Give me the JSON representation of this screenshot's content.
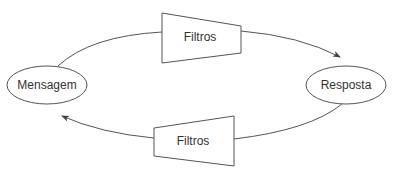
{
  "diagram": {
    "nodes": {
      "message": {
        "label": "Mensagem",
        "shape": "ellipse"
      },
      "response": {
        "label": "Resposta",
        "shape": "ellipse"
      },
      "filter_top": {
        "label": "Filtros",
        "shape": "trapezoid"
      },
      "filter_bottom": {
        "label": "Filtros",
        "shape": "trapezoid"
      }
    },
    "edges": [
      {
        "from": "Mensagem",
        "via": "Filtros (top)",
        "to": "Resposta",
        "direction": "clockwise-top"
      },
      {
        "from": "Resposta",
        "via": "Filtros (bottom)",
        "to": "Mensagem",
        "direction": "clockwise-bottom"
      }
    ],
    "colors": {
      "stroke": "#555555",
      "text": "#333333",
      "background": "#ffffff"
    }
  }
}
